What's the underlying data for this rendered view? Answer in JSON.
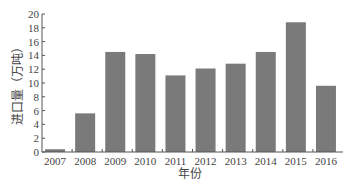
{
  "chart_data": {
    "type": "bar",
    "title": "",
    "xlabel": "年份",
    "ylabel": "进口量（万吨）",
    "categories": [
      "2007",
      "2008",
      "2009",
      "2010",
      "2011",
      "2012",
      "2013",
      "2014",
      "2015",
      "2016"
    ],
    "values": [
      0.4,
      5.6,
      14.5,
      14.2,
      11.1,
      12.1,
      12.8,
      14.5,
      18.8,
      9.6
    ],
    "ylim": [
      0,
      20
    ],
    "yticks": [
      0,
      2,
      4,
      6,
      8,
      10,
      12,
      14,
      16,
      18,
      20
    ],
    "grid": false,
    "bar_color": "#7a7a7a"
  }
}
